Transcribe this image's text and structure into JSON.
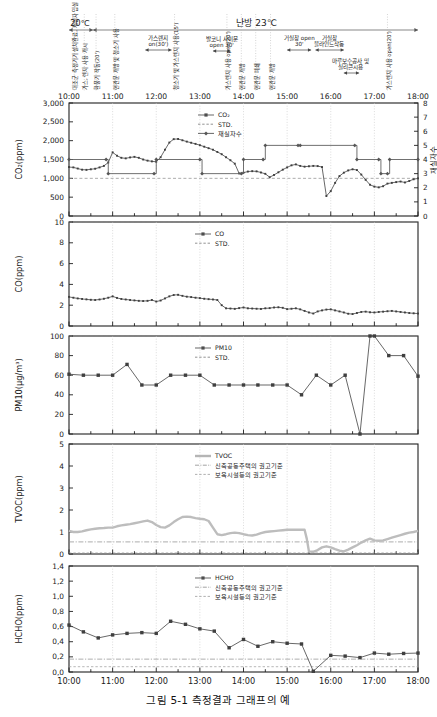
{
  "figure": {
    "caption": "그림 5-1  측정결과 그래프의 예",
    "width": 437,
    "height": 717
  },
  "time_axis": {
    "ticks": [
      "10:00",
      "11:00",
      "12:00",
      "13:00",
      "14:00",
      "15:00",
      "16:00",
      "17:00",
      "18:00"
    ],
    "start_hour": 10,
    "end_hour": 18,
    "minor_per_hour": 2
  },
  "event_band": {
    "spans": [
      {
        "label": "20℃",
        "start": 10.0,
        "end": 10.55,
        "label_pos": 10.25
      },
      {
        "label": "난방 23℃",
        "start": 10.55,
        "end": 18.0,
        "label_pos": 14.3
      }
    ],
    "vertical_notes": [
      {
        "text": "대조군 측정기기 설치완료, 재실자 입실 시작",
        "hour": 10.12
      },
      {
        "text": "가스, 렌지 사용 개시",
        "hour": 10.35
      },
      {
        "text": "환풍기 작동(20')",
        "hour": 10.62
      },
      {
        "text": "현관문 개방 및 청소기 사용",
        "hour": 11.05
      },
      {
        "text": "청소기 및 가스렌지 사용(15')",
        "hour": 12.42
      },
      {
        "text": "가스렌지 사용 open(20')",
        "hour": 13.62
      },
      {
        "text": "현관문 개방",
        "hour": 13.95
      },
      {
        "text": "현관문 폐쇄",
        "hour": 14.28
      },
      {
        "text": "현관문 개방",
        "hour": 14.62
      },
      {
        "text": "가스렌지 사용 open(20')",
        "hour": 17.3
      }
    ],
    "horizontal_notes": [
      {
        "text": "가스렌지 on(30')",
        "start": 11.75,
        "end": 12.35,
        "label_pos": 12.05
      },
      {
        "text": "발코니 사이문 open 30'",
        "start": 13.3,
        "end": 13.7,
        "label_pos": 13.5
      },
      {
        "text": "거실창 open 30'",
        "start": 15.0,
        "end": 15.55,
        "label_pos": 15.28
      },
      {
        "text": "거실창 블라인드작동",
        "start": 15.65,
        "end": 16.3,
        "label_pos": 15.97
      },
      {
        "text": "마루보수공사 및 실리콘시용",
        "start": 16.3,
        "end": 16.65,
        "label_pos": 16.45
      }
    ]
  },
  "chart_data": [
    {
      "type": "line",
      "id": "co2",
      "title": "",
      "ylabel": "CO₂(ppm)",
      "xlabel": "",
      "ylim": [
        0,
        3000
      ],
      "yticks": [
        0,
        500,
        1000,
        1500,
        2000,
        2500,
        3000
      ],
      "ytick_labels": [
        "0",
        "500",
        "1,000",
        "1,500",
        "2,000",
        "2,500",
        "3,000"
      ],
      "y2label": "재실자수",
      "y2lim": [
        0,
        8
      ],
      "y2ticks": [
        0,
        1,
        2,
        3,
        4,
        5,
        6,
        7,
        8
      ],
      "grid": true,
      "legend": [
        {
          "name": "CO₂",
          "style": "marker-line",
          "color": "#4d4d4d"
        },
        {
          "name": "STD.",
          "style": "dashed",
          "color": "#777777"
        },
        {
          "name": "재실자수",
          "style": "step-line",
          "color": "#555555"
        }
      ],
      "std_value": 1000,
      "series": [
        {
          "name": "CO₂",
          "axis": "left",
          "x": [
            10.0,
            10.1,
            10.2,
            10.3,
            10.4,
            10.5,
            10.6,
            10.7,
            10.8,
            10.9,
            11.0,
            11.1,
            11.2,
            11.3,
            11.4,
            11.5,
            11.6,
            11.7,
            11.8,
            11.9,
            12.0,
            12.1,
            12.2,
            12.3,
            12.4,
            12.5,
            12.6,
            12.7,
            12.8,
            12.9,
            13.0,
            13.1,
            13.2,
            13.3,
            13.4,
            13.5,
            13.6,
            13.7,
            13.8,
            13.9,
            14.0,
            14.1,
            14.2,
            14.3,
            14.4,
            14.5,
            14.6,
            14.7,
            14.8,
            14.9,
            15.0,
            15.1,
            15.2,
            15.3,
            15.4,
            15.5,
            15.6,
            15.7,
            15.8,
            15.9,
            16.0,
            16.1,
            16.2,
            16.3,
            16.4,
            16.5,
            16.6,
            16.7,
            16.8,
            16.9,
            17.0,
            17.1,
            17.2,
            17.3,
            17.4,
            17.5,
            17.6,
            17.7,
            17.8,
            17.9,
            18.0
          ],
          "y": [
            1300,
            1290,
            1260,
            1230,
            1225,
            1240,
            1255,
            1290,
            1330,
            1420,
            1690,
            1600,
            1545,
            1530,
            1555,
            1570,
            1545,
            1500,
            1470,
            1450,
            1440,
            1560,
            1760,
            1950,
            2040,
            2045,
            2010,
            1975,
            1945,
            1915,
            1880,
            1840,
            1800,
            1760,
            1700,
            1640,
            1560,
            1480,
            1390,
            1130,
            1150,
            1180,
            1190,
            1185,
            1155,
            1120,
            1030,
            1090,
            1160,
            1230,
            1290,
            1345,
            1370,
            1330,
            1310,
            1320,
            1330,
            1325,
            1300,
            530,
            660,
            880,
            1060,
            1150,
            1210,
            1240,
            1220,
            1100,
            960,
            830,
            780,
            760,
            790,
            860,
            880,
            900,
            915,
            890,
            930,
            975,
            1000
          ]
        },
        {
          "name": "재실자수",
          "axis": "right",
          "step": true,
          "x": [
            10.0,
            10.85,
            10.9,
            11.95,
            12.0,
            13.0,
            13.05,
            13.95,
            14.0,
            14.45,
            14.5,
            15.25,
            15.3,
            16.55,
            16.6,
            17.1,
            17.15,
            17.3,
            17.35,
            18.0
          ],
          "y": [
            4,
            4,
            3,
            3,
            4,
            4,
            3,
            3,
            4,
            4,
            5,
            5,
            5,
            5,
            4,
            4,
            3,
            3,
            4,
            4
          ]
        }
      ]
    },
    {
      "type": "line",
      "id": "co",
      "title": "",
      "ylabel": "CO(ppm)",
      "xlabel": "",
      "ylim": [
        0,
        10
      ],
      "yticks": [
        0,
        2,
        4,
        6,
        8,
        10
      ],
      "grid": true,
      "legend": [
        {
          "name": "CO",
          "style": "marker-line",
          "color": "#4d4d4d"
        },
        {
          "name": "STD.",
          "style": "dashed",
          "color": "#777777"
        }
      ],
      "std_value": 10,
      "series": [
        {
          "name": "CO",
          "axis": "left",
          "x": [
            10.0,
            10.1,
            10.2,
            10.3,
            10.4,
            10.5,
            10.6,
            10.7,
            10.8,
            10.9,
            11.0,
            11.1,
            11.2,
            11.3,
            11.4,
            11.5,
            11.6,
            11.7,
            11.8,
            11.9,
            12.0,
            12.1,
            12.2,
            12.3,
            12.4,
            12.5,
            12.6,
            12.7,
            12.8,
            12.9,
            13.0,
            13.1,
            13.2,
            13.3,
            13.4,
            13.5,
            13.6,
            13.7,
            13.8,
            13.9,
            14.0,
            14.1,
            14.2,
            14.3,
            14.4,
            14.5,
            14.6,
            14.7,
            14.8,
            14.9,
            15.0,
            15.1,
            15.2,
            15.3,
            15.4,
            15.5,
            15.6,
            15.7,
            15.8,
            15.9,
            16.0,
            16.1,
            16.2,
            16.3,
            16.4,
            16.5,
            16.6,
            16.7,
            16.8,
            16.9,
            17.0,
            17.1,
            17.2,
            17.3,
            17.4,
            17.5,
            17.6,
            17.7,
            17.8,
            17.9,
            18.0
          ],
          "y": [
            2.8,
            2.72,
            2.65,
            2.6,
            2.56,
            2.52,
            2.5,
            2.55,
            2.62,
            2.72,
            2.85,
            2.7,
            2.6,
            2.55,
            2.5,
            2.46,
            2.42,
            2.4,
            2.42,
            2.5,
            2.35,
            2.45,
            2.65,
            2.85,
            2.98,
            3.0,
            2.9,
            2.82,
            2.78,
            2.72,
            2.68,
            2.62,
            2.58,
            2.55,
            2.5,
            2.0,
            1.7,
            1.68,
            1.65,
            1.72,
            1.78,
            1.7,
            1.68,
            1.66,
            1.64,
            1.7,
            1.72,
            1.78,
            1.8,
            1.75,
            1.62,
            1.66,
            1.7,
            1.6,
            1.45,
            1.3,
            1.2,
            1.4,
            1.5,
            1.58,
            1.6,
            1.5,
            1.4,
            1.3,
            1.18,
            1.15,
            1.25,
            1.35,
            1.38,
            1.32,
            1.3,
            1.35,
            1.38,
            1.42,
            1.45,
            1.4,
            1.35,
            1.3,
            1.25,
            1.22,
            1.2
          ]
        }
      ]
    },
    {
      "type": "line",
      "id": "pm10",
      "title": "",
      "ylabel": "PM10(μg/m³)",
      "xlabel": "",
      "ylim": [
        0,
        100
      ],
      "yticks": [
        0,
        20,
        40,
        60,
        80,
        100
      ],
      "grid": true,
      "legend": [
        {
          "name": "PM10",
          "style": "marker-line",
          "color": "#4d4d4d"
        },
        {
          "name": "STD.",
          "style": "dashed",
          "color": "#777777"
        }
      ],
      "std_value": 100,
      "series": [
        {
          "name": "PM10",
          "axis": "left",
          "x": [
            10.0,
            10.33,
            10.67,
            11.0,
            11.33,
            11.67,
            12.0,
            12.33,
            12.67,
            13.0,
            13.33,
            13.67,
            14.0,
            14.33,
            14.67,
            15.0,
            15.33,
            15.67,
            16.0,
            16.33,
            16.67,
            16.9,
            17.0,
            17.33,
            17.67,
            18.0
          ],
          "y": [
            61,
            60,
            60,
            60,
            71,
            50,
            50,
            60,
            60,
            60,
            50,
            50,
            50,
            50,
            50,
            50,
            40,
            60,
            50,
            60,
            0,
            100,
            100,
            80,
            80,
            59
          ]
        }
      ]
    },
    {
      "type": "line",
      "id": "tvoc",
      "title": "",
      "ylabel": "TVOC(ppm)",
      "xlabel": "",
      "ylim": [
        0,
        5
      ],
      "yticks": [
        0,
        1,
        2,
        3,
        4,
        5
      ],
      "grid": true,
      "legend": [
        {
          "name": "TVOC",
          "style": "thick-line",
          "color": "#b5b5b5"
        },
        {
          "name": "신축공동주택의 권고기준",
          "style": "dashdot",
          "color": "#8a8a8a"
        },
        {
          "name": "보육시설등의 권고기준",
          "style": "dashed",
          "color": "#9a9a9a"
        }
      ],
      "guide_lines": [
        {
          "name": "신축공동주택의 권고기준",
          "value": 0.55
        },
        {
          "name": "보육시설등의 권고기준",
          "value": 0.05
        }
      ],
      "series": [
        {
          "name": "TVOC",
          "axis": "left",
          "x": [
            10.0,
            10.1,
            10.2,
            10.3,
            10.4,
            10.5,
            10.6,
            10.7,
            10.8,
            10.9,
            11.0,
            11.1,
            11.2,
            11.3,
            11.4,
            11.5,
            11.6,
            11.7,
            11.8,
            11.9,
            12.0,
            12.1,
            12.2,
            12.3,
            12.4,
            12.5,
            12.6,
            12.7,
            12.8,
            12.9,
            13.0,
            13.1,
            13.2,
            13.3,
            13.4,
            13.5,
            13.6,
            13.7,
            13.8,
            13.9,
            14.0,
            14.1,
            14.2,
            14.3,
            14.4,
            14.5,
            14.6,
            14.7,
            14.8,
            14.9,
            15.0,
            15.1,
            15.2,
            15.3,
            15.4,
            15.45,
            15.5,
            15.6,
            15.7,
            15.8,
            15.9,
            16.0,
            16.1,
            16.2,
            16.3,
            16.4,
            16.5,
            16.6,
            16.7,
            16.8,
            16.9,
            17.0,
            17.1,
            17.2,
            17.3,
            17.4,
            17.5,
            17.6,
            17.7,
            17.8,
            17.9,
            18.0
          ],
          "y": [
            1.05,
            1.0,
            1.0,
            1.03,
            1.08,
            1.12,
            1.15,
            1.17,
            1.18,
            1.2,
            1.2,
            1.26,
            1.3,
            1.33,
            1.36,
            1.4,
            1.44,
            1.48,
            1.52,
            1.45,
            1.32,
            1.22,
            1.2,
            1.3,
            1.45,
            1.58,
            1.68,
            1.7,
            1.68,
            1.63,
            1.6,
            1.58,
            1.5,
            1.2,
            0.9,
            0.86,
            0.9,
            0.95,
            0.97,
            0.95,
            0.9,
            0.86,
            0.84,
            0.88,
            0.95,
            1.0,
            1.02,
            1.04,
            1.06,
            1.08,
            1.1,
            1.1,
            1.1,
            1.1,
            1.1,
            0.7,
            0.12,
            0.1,
            0.18,
            0.3,
            0.35,
            0.3,
            0.22,
            0.15,
            0.12,
            0.2,
            0.3,
            0.4,
            0.52,
            0.62,
            0.7,
            0.62,
            0.6,
            0.62,
            0.68,
            0.74,
            0.8,
            0.86,
            0.92,
            0.97,
            1.0,
            1.05
          ]
        }
      ]
    },
    {
      "type": "line",
      "id": "hcho",
      "title": "",
      "ylabel": "HCHO(ppm)",
      "xlabel": "",
      "ylim": [
        0,
        1.4
      ],
      "yticks": [
        0.0,
        0.2,
        0.4,
        0.6,
        0.8,
        1.0,
        1.2,
        1.4
      ],
      "ytick_labels": [
        "0,0",
        "0,2",
        "0,4",
        "0,6",
        "0,8",
        "1,0",
        "1,2",
        "1,4"
      ],
      "grid": true,
      "legend": [
        {
          "name": "HCHO",
          "style": "marker-line",
          "color": "#4d4d4d"
        },
        {
          "name": "신축공동주택의 권고기준",
          "style": "dashdot",
          "color": "#8a8a8a"
        },
        {
          "name": "보육시설등의 권고기준",
          "style": "dashed",
          "color": "#9a9a9a"
        }
      ],
      "guide_lines": [
        {
          "name": "신축공동주택의 권고기준",
          "value": 0.17
        },
        {
          "name": "보육시설등의 권고기준",
          "value": 0.07
        }
      ],
      "series": [
        {
          "name": "HCHO",
          "axis": "left",
          "x": [
            10.0,
            10.33,
            10.67,
            11.0,
            11.33,
            11.67,
            12.0,
            12.33,
            12.67,
            13.0,
            13.33,
            13.67,
            14.0,
            14.33,
            14.67,
            15.0,
            15.33,
            15.6,
            16.0,
            16.33,
            16.67,
            17.0,
            17.33,
            17.67,
            18.0
          ],
          "y": [
            0.62,
            0.53,
            0.45,
            0.49,
            0.51,
            0.52,
            0.51,
            0.67,
            0.63,
            0.57,
            0.54,
            0.32,
            0.43,
            0.34,
            0.4,
            0.38,
            0.37,
            0.01,
            0.22,
            0.21,
            0.19,
            0.25,
            0.235,
            0.245,
            0.25
          ]
        }
      ]
    }
  ]
}
